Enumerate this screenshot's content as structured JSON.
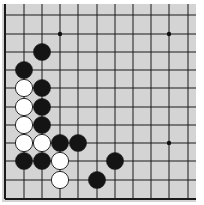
{
  "diagram": {
    "type": "go-board-fragment",
    "board_color": "#d4d4d4",
    "line_color": "#1a1a1a",
    "columns_x": [
      5,
      24,
      42,
      60,
      78,
      97,
      115,
      133,
      151,
      169,
      188
    ],
    "rows_y": [
      15,
      34,
      52,
      70,
      88,
      107,
      125,
      143,
      161,
      180,
      199
    ],
    "edges": {
      "left": true,
      "bottom": true,
      "top": false,
      "right": false
    },
    "star_points": [
      [
        3,
        1
      ],
      [
        9,
        1
      ],
      [
        9,
        7
      ]
    ],
    "stones": [
      {
        "color": "black",
        "col": 2,
        "row": 2
      },
      {
        "color": "black",
        "col": 1,
        "row": 3
      },
      {
        "color": "white",
        "col": 1,
        "row": 4
      },
      {
        "color": "black",
        "col": 2,
        "row": 4
      },
      {
        "color": "white",
        "col": 1,
        "row": 5
      },
      {
        "color": "black",
        "col": 2,
        "row": 5
      },
      {
        "color": "white",
        "col": 1,
        "row": 6
      },
      {
        "color": "black",
        "col": 2,
        "row": 6
      },
      {
        "color": "white",
        "col": 1,
        "row": 7
      },
      {
        "color": "white",
        "col": 2,
        "row": 7
      },
      {
        "color": "black",
        "col": 3,
        "row": 7
      },
      {
        "color": "black",
        "col": 4,
        "row": 7
      },
      {
        "color": "black",
        "col": 1,
        "row": 8
      },
      {
        "color": "black",
        "col": 2,
        "row": 8
      },
      {
        "color": "white",
        "col": 3,
        "row": 8
      },
      {
        "color": "black",
        "col": 6,
        "row": 8
      },
      {
        "color": "white",
        "col": 3,
        "row": 9
      },
      {
        "color": "black",
        "col": 5,
        "row": 9
      }
    ]
  }
}
